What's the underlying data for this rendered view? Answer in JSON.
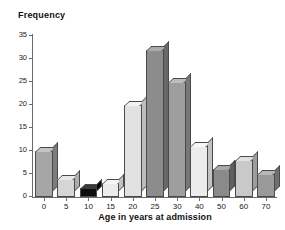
{
  "chart_data": {
    "type": "bar",
    "title": "",
    "xlabel": "Age in years at admission",
    "ylabel": "Frequency",
    "categories": [
      "0",
      "5",
      "10",
      "15",
      "20",
      "25",
      "30",
      "40",
      "50",
      "60",
      "70"
    ],
    "values": [
      10,
      4,
      2,
      3,
      20,
      32,
      25,
      11,
      6,
      8,
      5
    ],
    "bar_colors": [
      "#a6a6a6",
      "#d6d6d6",
      "#0d0d0d",
      "#ececec",
      "#e2e2e2",
      "#8c8c8c",
      "#9e9e9e",
      "#ececec",
      "#8a8a8a",
      "#c9c9c9",
      "#9a9a9a"
    ],
    "bar_top_colors": [
      "#c4c4c4",
      "#e8e8e8",
      "#3a3a3a",
      "#f7f7f7",
      "#f2f2f2",
      "#ababab",
      "#bcbcbc",
      "#f7f7f7",
      "#a8a8a8",
      "#e0e0e0",
      "#b8b8b8"
    ],
    "bar_side_colors": [
      "#7d7d7d",
      "#adadad",
      "#000000",
      "#c2c2c2",
      "#bdbdbd",
      "#686868",
      "#777777",
      "#c2c2c2",
      "#5f5f5f",
      "#9c9c9c",
      "#6f6f6f"
    ],
    "ytick_labels": [
      "0",
      "5",
      "10",
      "15",
      "20",
      "25",
      "30",
      "35"
    ],
    "ytick_values": [
      0,
      5,
      10,
      15,
      20,
      25,
      30,
      35
    ],
    "ylim": [
      0,
      35
    ],
    "grid": false,
    "legend": false,
    "axis_color": "#6b6b6b",
    "background": "#ffffff"
  }
}
